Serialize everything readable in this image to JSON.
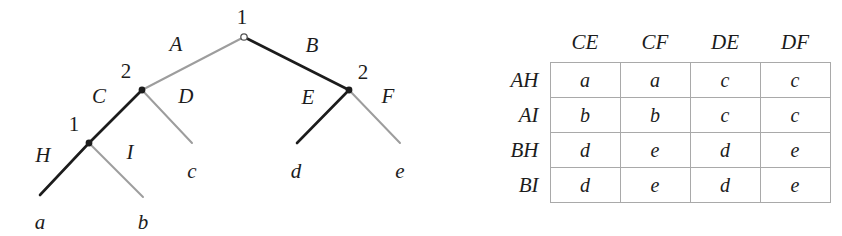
{
  "figure": {
    "background_color": "#ffffff",
    "dark_edge_color": "#1c1c1c",
    "light_edge_color": "#9d9d9d",
    "grid_color": "#a9a9a9",
    "text_color": "#1c1c1c"
  },
  "tree": {
    "nodes": [
      {
        "id": "root",
        "label": "1",
        "player": "1",
        "style": "open",
        "x": 244,
        "y": 37,
        "label_x": 242,
        "label_y": 17
      },
      {
        "id": "left-2",
        "label": "2",
        "player": "2",
        "style": "filled",
        "x": 142,
        "y": 90,
        "label_x": 126,
        "label_y": 71
      },
      {
        "id": "left-1",
        "label": "1",
        "player": "1",
        "style": "filled",
        "x": 89,
        "y": 143,
        "label_x": 74,
        "label_y": 124
      },
      {
        "id": "right-2",
        "label": "2",
        "player": "2",
        "style": "filled",
        "x": 349,
        "y": 90,
        "label_x": 363,
        "label_y": 72
      }
    ],
    "edges": [
      {
        "id": "edge-A",
        "label": "A",
        "shade": "light",
        "x1": 244,
        "y1": 37,
        "x2": 142,
        "y2": 90,
        "label_x": 176,
        "label_y": 44
      },
      {
        "id": "edge-B",
        "label": "B",
        "shade": "dark",
        "x1": 244,
        "y1": 37,
        "x2": 349,
        "y2": 90,
        "label_x": 312,
        "label_y": 45
      },
      {
        "id": "edge-C",
        "label": "C",
        "shade": "dark",
        "x1": 142,
        "y1": 90,
        "x2": 89,
        "y2": 143,
        "label_x": 99,
        "label_y": 96
      },
      {
        "id": "edge-D",
        "label": "D",
        "shade": "light",
        "x1": 142,
        "y1": 90,
        "x2": 192,
        "y2": 143,
        "label_x": 186,
        "label_y": 96
      },
      {
        "id": "edge-H",
        "label": "H",
        "shade": "dark",
        "x1": 89,
        "y1": 143,
        "x2": 40,
        "y2": 195,
        "label_x": 43,
        "label_y": 155
      },
      {
        "id": "edge-I",
        "label": "I",
        "shade": "light",
        "x1": 89,
        "y1": 143,
        "x2": 143,
        "y2": 197,
        "label_x": 130,
        "label_y": 152
      },
      {
        "id": "edge-E",
        "label": "E",
        "shade": "dark",
        "x1": 349,
        "y1": 90,
        "x2": 297,
        "y2": 143,
        "label_x": 308,
        "label_y": 97
      },
      {
        "id": "edge-F",
        "label": "F",
        "shade": "light",
        "x1": 349,
        "y1": 90,
        "x2": 400,
        "y2": 143,
        "label_x": 388,
        "label_y": 96
      }
    ],
    "leaves": [
      {
        "id": "leaf-a",
        "label": "a",
        "x": 40,
        "y": 222
      },
      {
        "id": "leaf-b",
        "label": "b",
        "x": 143,
        "y": 222
      },
      {
        "id": "leaf-c",
        "label": "c",
        "x": 192,
        "y": 171
      },
      {
        "id": "leaf-d",
        "label": "d",
        "x": 296,
        "y": 171
      },
      {
        "id": "leaf-e",
        "label": "e",
        "x": 400,
        "y": 171
      }
    ]
  },
  "matrix": {
    "corner_label": "",
    "column_headers": [
      "CE",
      "CF",
      "DE",
      "DF"
    ],
    "row_headers": [
      "AH",
      "AI",
      "BH",
      "BI"
    ],
    "rows": [
      {
        "header": "AH",
        "cells": [
          "a",
          "a",
          "c",
          "c"
        ]
      },
      {
        "header": "AI",
        "cells": [
          "b",
          "b",
          "c",
          "c"
        ]
      },
      {
        "header": "BH",
        "cells": [
          "d",
          "e",
          "d",
          "e"
        ]
      },
      {
        "header": "BI",
        "cells": [
          "d",
          "e",
          "d",
          "e"
        ]
      }
    ]
  },
  "chart_data": {
    "type": "table",
    "categories": [
      "CE",
      "CF",
      "DE",
      "DF"
    ],
    "row_categories": [
      "AH",
      "AI",
      "BH",
      "BI"
    ],
    "values": [
      [
        "a",
        "a",
        "c",
        "c"
      ],
      [
        "b",
        "b",
        "c",
        "c"
      ],
      [
        "d",
        "e",
        "d",
        "e"
      ],
      [
        "d",
        "e",
        "d",
        "e"
      ]
    ],
    "xlabel": "Player 2 strategies",
    "ylabel": "Player 1 strategies",
    "legend": [],
    "grid": true,
    "tree_actions_player1": [
      "A",
      "B",
      "H",
      "I"
    ],
    "tree_actions_player2": [
      "C",
      "D",
      "E",
      "F"
    ],
    "outcomes": [
      "a",
      "b",
      "c",
      "d",
      "e"
    ]
  }
}
